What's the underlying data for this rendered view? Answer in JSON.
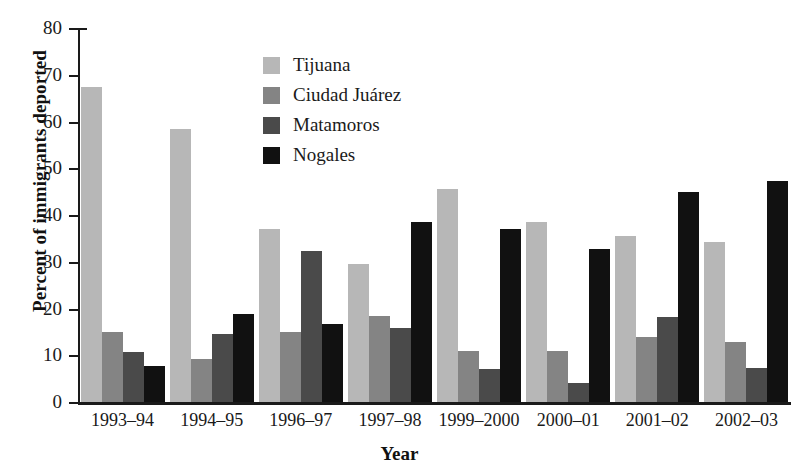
{
  "chart_data": {
    "type": "bar",
    "title": "",
    "xlabel": "Year",
    "ylabel": "Percent of immigrants deported",
    "ylim": [
      0,
      80
    ],
    "yticks": [
      0,
      10,
      20,
      30,
      40,
      50,
      60,
      70,
      80
    ],
    "grid": false,
    "legend_position": "upper-center",
    "categories": [
      "1993–94",
      "1994–95",
      "1996–97",
      "1997–98",
      "1999–2000",
      "2000–01",
      "2001–02",
      "2002–03"
    ],
    "series": [
      {
        "name": "Tijuana",
        "color": "#b7b7b7",
        "values": [
          67.4,
          58.4,
          37.0,
          29.5,
          45.5,
          38.6,
          35.5,
          34.3
        ]
      },
      {
        "name": "Ciudad Juárez",
        "color": "#848484",
        "values": [
          15.0,
          9.1,
          15.0,
          18.3,
          10.9,
          11.0,
          14.0,
          12.9
        ]
      },
      {
        "name": "Matamoros",
        "color": "#4a4a4a",
        "values": [
          10.6,
          14.6,
          32.3,
          15.9,
          7.1,
          4.0,
          18.1,
          7.2
        ]
      },
      {
        "name": "Nogales",
        "color": "#111111",
        "values": [
          7.6,
          18.9,
          16.6,
          38.6,
          37.0,
          32.8,
          44.9,
          47.3
        ]
      }
    ]
  }
}
